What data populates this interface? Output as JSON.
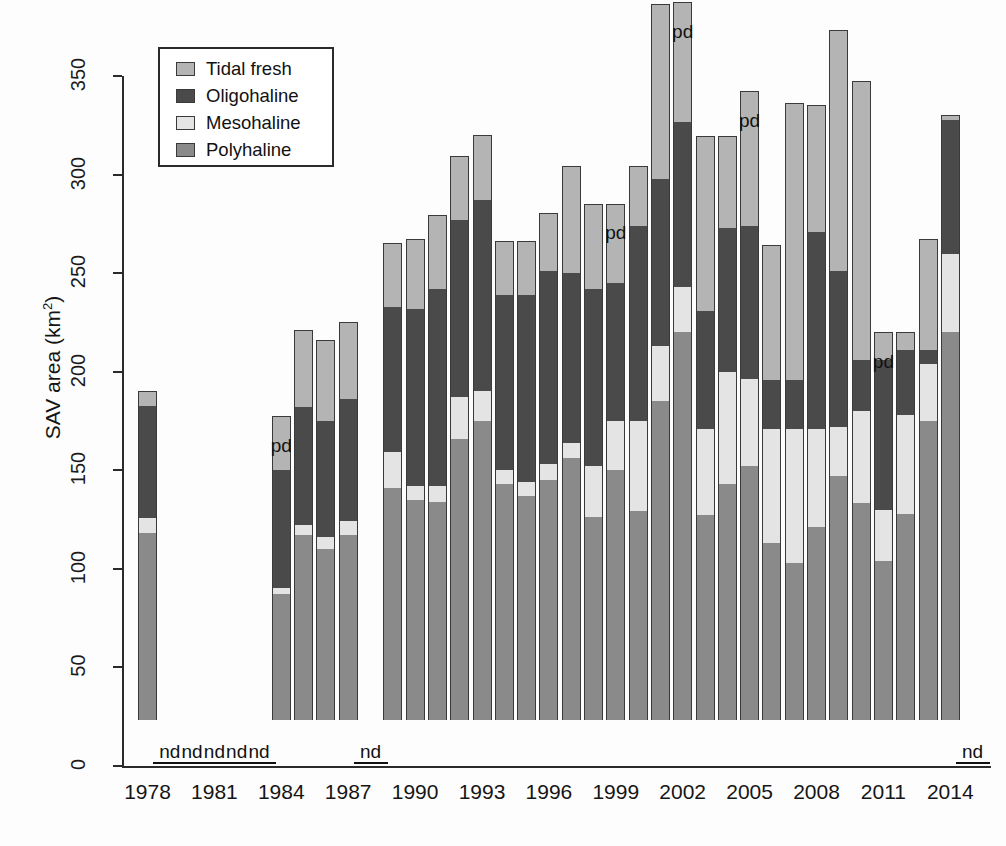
{
  "chart_data": {
    "type": "bar",
    "subtype": "stacked",
    "title": "",
    "xlabel": "",
    "ylabel": "SAV area (km2)",
    "ylabel_html": "SAV area (km<sup>2</sup>)",
    "ylim": [
      0,
      375
    ],
    "yticks": [
      0,
      50,
      100,
      150,
      200,
      250,
      300,
      350
    ],
    "ytick_labels": [
      "0",
      "50",
      "100",
      "150",
      "200",
      "250",
      "300",
      "350"
    ],
    "xticks": [
      1978,
      1981,
      1984,
      1987,
      1990,
      1993,
      1996,
      1999,
      2002,
      2005,
      2008,
      2011,
      2014
    ],
    "xtick_labels": [
      "1978",
      "1981",
      "1984",
      "1987",
      "1990",
      "1993",
      "1996",
      "1999",
      "2002",
      "2005",
      "2008",
      "2011",
      "2014"
    ],
    "grid": false,
    "legend_position": "top-left",
    "legend_order_top_to_bottom": [
      "Tidal fresh",
      "Oligohaline",
      "Mesohaline",
      "Polyhaline"
    ],
    "stack_order_bottom_to_top": [
      "Polyhaline",
      "Mesohaline",
      "Oligohaline",
      "Tidal fresh"
    ],
    "colors": {
      "Tidal fresh": "#b4b4b4",
      "Oligohaline": "#4a4a4a",
      "Mesohaline": "#e4e4e4",
      "Polyhaline": "#8a8a8a",
      "axis": "#2b2b2b",
      "background": "#fdfdfd"
    },
    "annotations": {
      "nd_label": "nd",
      "nd_years": [
        1979,
        1980,
        1981,
        1982,
        1983,
        1988
      ],
      "nd_meaning_text": "nd",
      "pd_label": "pd",
      "pd_years": [
        1984,
        1999,
        2002,
        2005,
        2011
      ]
    },
    "years": [
      1978,
      1979,
      1980,
      1981,
      1982,
      1983,
      1984,
      1985,
      1986,
      1987,
      1988,
      1989,
      1990,
      1991,
      1992,
      1993,
      1994,
      1995,
      1996,
      1997,
      1998,
      1999,
      2000,
      2001,
      2002,
      2003,
      2004,
      2005,
      2006,
      2007,
      2008,
      2009,
      2010,
      2011,
      2012,
      2013,
      2014,
      2015
    ],
    "series": [
      {
        "name": "Polyhaline",
        "values": [
          95,
          null,
          null,
          null,
          null,
          null,
          64,
          94,
          87,
          94,
          null,
          118,
          112,
          111,
          143,
          152,
          120,
          114,
          122,
          133,
          103,
          127,
          106,
          162,
          197,
          104,
          120,
          129,
          90,
          80,
          98,
          124,
          110,
          81,
          105,
          152,
          197,
          null
        ]
      },
      {
        "name": "Mesohaline",
        "values": [
          8,
          null,
          null,
          null,
          null,
          null,
          3,
          5,
          6,
          7,
          null,
          18,
          7,
          8,
          21,
          15,
          7,
          7,
          8,
          8,
          26,
          25,
          46,
          28,
          23,
          44,
          57,
          44,
          58,
          68,
          50,
          25,
          47,
          26,
          50,
          29,
          40,
          null
        ]
      },
      {
        "name": "Oligohaline",
        "values": [
          57,
          null,
          null,
          null,
          null,
          null,
          60,
          60,
          59,
          62,
          null,
          74,
          90,
          100,
          90,
          97,
          89,
          95,
          98,
          86,
          90,
          70,
          99,
          85,
          84,
          60,
          73,
          78,
          25,
          25,
          100,
          79,
          26,
          76,
          33,
          7,
          68,
          null
        ]
      },
      {
        "name": "Tidal fresh",
        "values": [
          7,
          null,
          null,
          null,
          null,
          null,
          27,
          39,
          41,
          39,
          null,
          32,
          35,
          37,
          32,
          33,
          27,
          27,
          29,
          54,
          43,
          40,
          30,
          88,
          60,
          88,
          46,
          68,
          68,
          140,
          64,
          122,
          141,
          14,
          9,
          56,
          2,
          null
        ]
      }
    ],
    "totals": [
      167,
      null,
      null,
      null,
      null,
      null,
      154,
      198,
      193,
      202,
      null,
      242,
      244,
      256,
      286,
      297,
      243,
      243,
      257,
      281,
      262,
      262,
      281,
      363,
      364,
      296,
      296,
      319,
      241,
      313,
      312,
      350,
      324,
      197,
      197,
      244,
      307,
      375
    ]
  },
  "legend": {
    "items": [
      {
        "label": "Tidal fresh",
        "color": "#b4b4b4"
      },
      {
        "label": "Oligohaline",
        "color": "#4a4a4a"
      },
      {
        "label": "Mesohaline",
        "color": "#e4e4e4"
      },
      {
        "label": "Polyhaline",
        "color": "#8a8a8a"
      }
    ]
  }
}
